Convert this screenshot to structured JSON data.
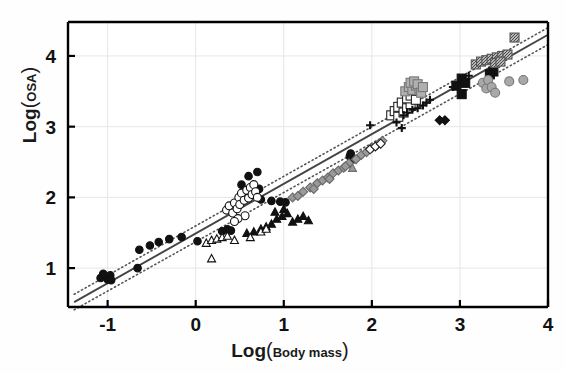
{
  "chart_data": {
    "type": "scatter",
    "title": "",
    "xlabel": "Log(Body mass)",
    "xlabel_main": "Log",
    "xlabel_sub": "Body mass",
    "ylabel": "Log(OSA)",
    "ylabel_main": "Log",
    "ylabel_sub": "OSA",
    "xlim": [
      -1.45,
      4.0
    ],
    "ylim": [
      0.45,
      4.48
    ],
    "xticks": [
      -1,
      0,
      1,
      2,
      3,
      4
    ],
    "xticklabels": [
      "-1",
      "0",
      "1",
      "2",
      "3",
      "4"
    ],
    "yticks": [
      1,
      2,
      3,
      4
    ],
    "yticklabels": [
      "1",
      "2",
      "3",
      "4"
    ],
    "grid": true,
    "grid_color": "#e6e6e6",
    "legend": "none",
    "frame_color": "#000000",
    "annotations": [
      "Solid line: fitted regression line",
      "Dotted lines: confidence band above and below the regression"
    ],
    "fit_line": {
      "style": "solid",
      "color": "#444444",
      "x": [
        -1.38,
        4.0
      ],
      "y": [
        0.52,
        4.3
      ]
    },
    "confidence_bands": [
      {
        "name": "upper",
        "style": "dotted",
        "color": "#555555",
        "x": [
          -1.38,
          4.0
        ],
        "y": [
          0.63,
          4.4
        ]
      },
      {
        "name": "lower",
        "style": "dotted",
        "color": "#555555",
        "x": [
          -1.38,
          4.0
        ],
        "y": [
          0.41,
          4.16
        ]
      }
    ],
    "series": [
      {
        "name": "filled-circle-black",
        "marker": "circle",
        "fill": "#111111",
        "edge": "#111111",
        "size": 7.5,
        "points": [
          [
            -1.08,
            0.86
          ],
          [
            -1.05,
            0.92
          ],
          [
            -1.0,
            0.84
          ],
          [
            -0.97,
            0.9
          ],
          [
            -0.96,
            0.83
          ],
          [
            -0.66,
            1.0
          ],
          [
            -0.64,
            1.26
          ],
          [
            -0.52,
            1.32
          ],
          [
            -0.42,
            1.37
          ],
          [
            -0.3,
            1.41
          ],
          [
            -0.16,
            1.44
          ],
          [
            0.02,
            1.38
          ],
          [
            0.3,
            1.52
          ],
          [
            0.36,
            1.55
          ],
          [
            0.4,
            1.53
          ],
          [
            0.52,
            2.18
          ],
          [
            0.6,
            2.3
          ],
          [
            0.63,
            2.03
          ],
          [
            0.7,
            2.36
          ],
          [
            0.72,
            2.12
          ],
          [
            0.74,
            1.97
          ],
          [
            0.86,
            1.95
          ],
          [
            0.96,
            1.94
          ],
          [
            1.02,
            1.93
          ],
          [
            1.75,
            2.58
          ],
          [
            1.76,
            2.62
          ],
          [
            1.8,
            2.54
          ]
        ]
      },
      {
        "name": "open-circle",
        "marker": "circle",
        "fill": "#ffffff",
        "edge": "#111111",
        "size": 8,
        "points": [
          [
            0.35,
            1.82
          ],
          [
            0.38,
            1.88
          ],
          [
            0.42,
            1.78
          ],
          [
            0.44,
            1.92
          ],
          [
            0.47,
            1.84
          ],
          [
            0.49,
            2.0
          ],
          [
            0.5,
            1.9
          ],
          [
            0.52,
            2.06
          ],
          [
            0.55,
            1.96
          ],
          [
            0.58,
            2.1
          ],
          [
            0.6,
            1.99
          ],
          [
            0.62,
            2.14
          ],
          [
            0.64,
            2.04
          ],
          [
            0.66,
            2.18
          ],
          [
            0.68,
            2.08
          ],
          [
            0.7,
            2.0
          ],
          [
            0.56,
            1.74
          ],
          [
            0.48,
            1.7
          ],
          [
            0.44,
            1.66
          ]
        ]
      },
      {
        "name": "filled-triangle-black",
        "marker": "triangle",
        "fill": "#111111",
        "edge": "#111111",
        "size": 8,
        "points": [
          [
            0.58,
            1.5
          ],
          [
            0.66,
            1.52
          ],
          [
            0.74,
            1.56
          ],
          [
            0.8,
            1.59
          ],
          [
            0.86,
            1.63
          ],
          [
            0.92,
            1.7
          ],
          [
            0.98,
            1.74
          ],
          [
            1.04,
            1.78
          ],
          [
            1.1,
            1.66
          ],
          [
            1.16,
            1.7
          ],
          [
            1.22,
            1.74
          ],
          [
            1.28,
            1.68
          ],
          [
            0.9,
            1.8
          ],
          [
            1.0,
            1.84
          ]
        ]
      },
      {
        "name": "open-triangle",
        "marker": "triangle",
        "fill": "#ffffff",
        "edge": "#111111",
        "size": 8,
        "points": [
          [
            0.12,
            1.36
          ],
          [
            0.18,
            1.4
          ],
          [
            0.24,
            1.42
          ],
          [
            0.3,
            1.44
          ],
          [
            0.36,
            1.46
          ],
          [
            0.44,
            1.4
          ],
          [
            0.62,
            1.44
          ],
          [
            0.74,
            1.52
          ],
          [
            0.8,
            1.56
          ],
          [
            0.18,
            1.14
          ]
        ]
      },
      {
        "name": "gray-triangle",
        "marker": "triangle",
        "fill": "#9a9a9a",
        "edge": "#6e6e6e",
        "size": 8,
        "points": [
          [
            1.78,
            2.42
          ]
        ]
      },
      {
        "name": "gray-diamond",
        "marker": "diamond",
        "fill": "#9a9a9a",
        "edge": "#6a6a6a",
        "size": 8,
        "points": [
          [
            1.1,
            2.0
          ],
          [
            1.16,
            2.02
          ],
          [
            1.22,
            2.08
          ],
          [
            1.3,
            2.14
          ],
          [
            1.38,
            2.2
          ],
          [
            1.44,
            2.24
          ],
          [
            1.5,
            2.28
          ],
          [
            1.56,
            2.34
          ],
          [
            1.62,
            2.38
          ],
          [
            1.68,
            2.42
          ],
          [
            1.74,
            2.48
          ],
          [
            1.82,
            2.54
          ],
          [
            1.88,
            2.6
          ],
          [
            1.94,
            2.64
          ],
          [
            2.0,
            2.7
          ],
          [
            2.06,
            2.74
          ],
          [
            2.12,
            2.8
          ],
          [
            1.34,
            2.12
          ],
          [
            1.52,
            2.26
          ],
          [
            1.7,
            2.44
          ]
        ]
      },
      {
        "name": "open-diamond",
        "marker": "diamond",
        "fill": "#ffffff",
        "edge": "#222222",
        "size": 8,
        "points": [
          [
            1.98,
            2.68
          ],
          [
            2.04,
            2.72
          ],
          [
            2.1,
            2.76
          ]
        ]
      },
      {
        "name": "black-diamond",
        "marker": "diamond",
        "fill": "#111111",
        "edge": "#111111",
        "size": 8,
        "points": [
          [
            2.77,
            3.09
          ],
          [
            2.83,
            3.09
          ]
        ]
      },
      {
        "name": "open-square",
        "marker": "square",
        "fill": "#ffffff",
        "edge": "#222222",
        "size": 9,
        "points": [
          [
            2.22,
            3.16
          ],
          [
            2.26,
            3.22
          ],
          [
            2.3,
            3.28
          ],
          [
            2.34,
            3.34
          ],
          [
            2.3,
            3.14
          ],
          [
            2.36,
            3.2
          ],
          [
            2.4,
            3.26
          ],
          [
            2.44,
            3.32
          ],
          [
            2.4,
            3.4
          ],
          [
            2.44,
            3.44
          ],
          [
            2.5,
            3.38
          ]
        ]
      },
      {
        "name": "gray-square",
        "marker": "square",
        "fill": "#b0b0b0",
        "edge": "#777777",
        "size": 9,
        "points": [
          [
            2.38,
            3.5
          ],
          [
            2.42,
            3.56
          ],
          [
            2.46,
            3.52
          ],
          [
            2.5,
            3.58
          ],
          [
            2.54,
            3.54
          ],
          [
            2.44,
            3.62
          ],
          [
            2.48,
            3.64
          ],
          [
            2.52,
            3.6
          ],
          [
            2.56,
            3.48
          ],
          [
            2.58,
            3.56
          ]
        ]
      },
      {
        "name": "black-square",
        "marker": "square",
        "fill": "#111111",
        "edge": "#111111",
        "size": 9,
        "points": [
          [
            2.96,
            3.58
          ],
          [
            3.02,
            3.68
          ],
          [
            3.06,
            3.62
          ],
          [
            3.02,
            3.46
          ],
          [
            3.34,
            3.74
          ],
          [
            3.38,
            3.78
          ]
        ]
      },
      {
        "name": "gray-hatched-square",
        "marker": "square-hatched",
        "fill": "#b8b8b8",
        "edge": "#555555",
        "size": 9,
        "points": [
          [
            3.18,
            3.88
          ],
          [
            3.24,
            3.92
          ],
          [
            3.3,
            3.94
          ],
          [
            3.36,
            3.96
          ],
          [
            3.42,
            3.98
          ],
          [
            3.48,
            4.0
          ],
          [
            3.54,
            4.02
          ],
          [
            3.62,
            4.26
          ],
          [
            3.4,
            3.9
          ],
          [
            3.46,
            3.92
          ]
        ]
      },
      {
        "name": "gray-circle",
        "marker": "circle",
        "fill": "#a8a8a8",
        "edge": "#777777",
        "size": 9,
        "points": [
          [
            3.26,
            3.62
          ],
          [
            3.3,
            3.54
          ],
          [
            3.32,
            3.66
          ],
          [
            3.36,
            3.56
          ],
          [
            3.4,
            3.48
          ],
          [
            3.56,
            3.64
          ],
          [
            3.72,
            3.66
          ]
        ]
      },
      {
        "name": "plus-marker",
        "marker": "plus",
        "fill": "#111111",
        "edge": "#111111",
        "size": 8,
        "points": [
          [
            1.98,
            3.02
          ],
          [
            2.28,
            3.06
          ],
          [
            2.36,
            3.16
          ],
          [
            2.4,
            3.2
          ],
          [
            2.46,
            3.24
          ],
          [
            2.52,
            3.26
          ],
          [
            2.58,
            3.3
          ],
          [
            2.62,
            3.34
          ],
          [
            2.34,
            2.98
          ],
          [
            2.66,
            3.38
          ],
          [
            2.92,
            3.56
          ],
          [
            3.1,
            3.72
          ]
        ]
      }
    ]
  }
}
